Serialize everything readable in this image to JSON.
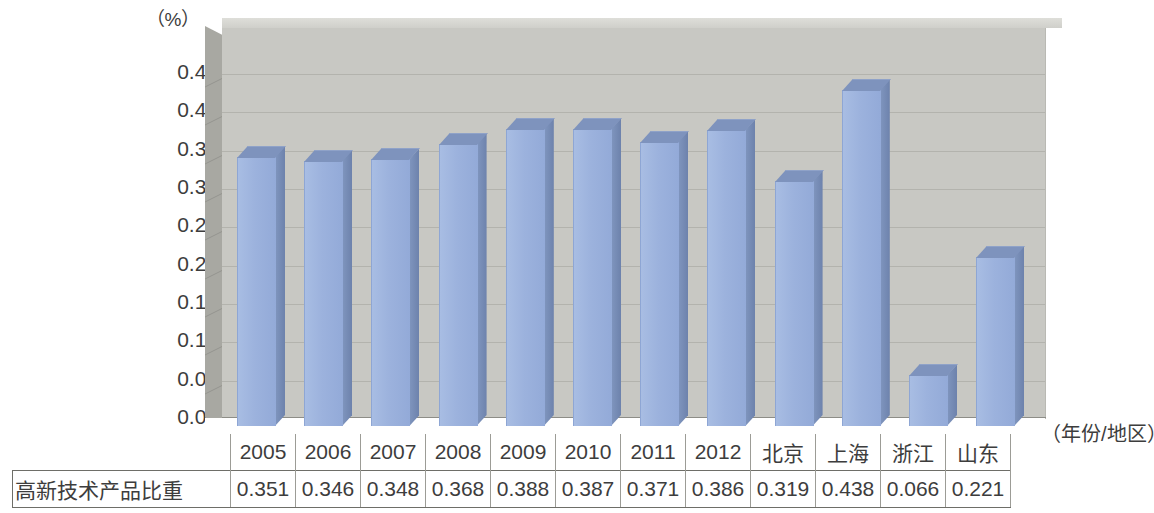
{
  "chart_data": {
    "type": "bar",
    "title": "",
    "subtitle": "",
    "xlabel": "（年份/地区）",
    "ylabel": "（%）",
    "ylim": [
      0.0,
      0.45
    ],
    "ytick_labels": [
      "0.45",
      "0.40",
      "0.35",
      "0.30",
      "0.25",
      "0.20",
      "0.15",
      "0.10",
      "0.05",
      "0.00"
    ],
    "ytick_values": [
      0.45,
      0.4,
      0.35,
      0.3,
      0.25,
      0.2,
      0.15,
      0.1,
      0.05,
      0.0
    ],
    "grid": true,
    "legend": "none",
    "three_d": true,
    "categories": [
      "2005",
      "2006",
      "2007",
      "2008",
      "2009",
      "2010",
      "2011",
      "2012",
      "北京",
      "上海",
      "浙江",
      "山东"
    ],
    "series": [
      {
        "name": "高新技术产品比重",
        "values": [
          0.351,
          0.346,
          0.348,
          0.368,
          0.388,
          0.387,
          0.371,
          0.386,
          0.319,
          0.438,
          0.066,
          0.221
        ]
      }
    ],
    "value_labels": [
      "0.351",
      "0.346",
      "0.348",
      "0.368",
      "0.388",
      "0.387",
      "0.371",
      "0.386",
      "0.319",
      "0.438",
      "0.066",
      "0.221"
    ],
    "colors": {
      "bar_front": "#9cb2dd",
      "bar_side": "#7388b2",
      "bar_top": "#7e93bd",
      "plot_back_wall": "#c8c8c3",
      "plot_side_wall": "#a8a8a2",
      "gridline": "#b3b3ad",
      "text": "#3d3d3d",
      "table_border": "#6e6e68"
    }
  },
  "table": {
    "row_label": "高新技术产品比重",
    "header": [
      "2005",
      "2006",
      "2007",
      "2008",
      "2009",
      "2010",
      "2011",
      "2012",
      "北京",
      "上海",
      "浙江",
      "山东"
    ],
    "values": [
      "0.351",
      "0.346",
      "0.348",
      "0.368",
      "0.388",
      "0.387",
      "0.371",
      "0.386",
      "0.319",
      "0.438",
      "0.066",
      "0.221"
    ]
  },
  "axis": {
    "unit_label": "（%）",
    "x_caption": "（年份/地区）",
    "ticks": [
      "0.45",
      "0.40",
      "0.35",
      "0.30",
      "0.25",
      "0.20",
      "0.15",
      "0.10",
      "0.05",
      "0.00"
    ]
  }
}
